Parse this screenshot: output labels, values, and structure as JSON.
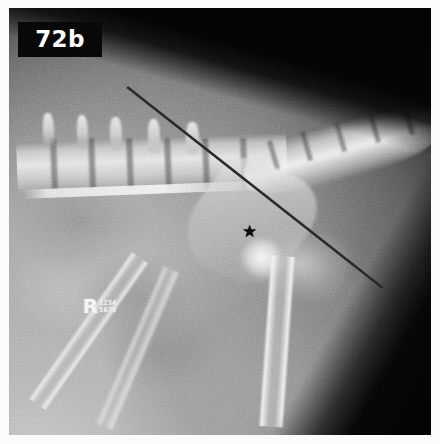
{
  "figure": {
    "label": "72b",
    "caption_present": false
  },
  "image": {
    "modality": "radiograph",
    "view": "lateral",
    "region": "caudal lumbar spine, pelvis and hip",
    "width": 440,
    "height": 444,
    "border_color": "#fbfbfb",
    "background_color": "#050505"
  },
  "annotations": {
    "badge": {
      "text": "72b",
      "text_color": "#ffffff",
      "background_color": "#080808"
    },
    "star": {
      "glyph": "★",
      "color": "#0d0d0d",
      "x_pct": 55.3,
      "y_pct": 50.6
    },
    "measurement_line": {
      "color": "#2a2a2a",
      "stroke_width": 2.6,
      "x1_pct": 28.0,
      "y1_pct": 18.5,
      "x2_pct": 88.5,
      "y2_pct": 65.5
    },
    "side_marker": {
      "letter": "R",
      "id_text": "1234\n5678",
      "color": "#f4f4f4"
    }
  },
  "anatomy": {
    "discs_x_pct": [
      10,
      19,
      28,
      37,
      46,
      55
    ],
    "spinous_processes": [
      {
        "left_pct": 8,
        "top_pct": 24.5,
        "width_pct": 2.6,
        "height_pct": 8.0,
        "rotate_deg": -3
      },
      {
        "left_pct": 16,
        "top_pct": 25.0,
        "width_pct": 2.6,
        "height_pct": 8.0,
        "rotate_deg": -3
      },
      {
        "left_pct": 24,
        "top_pct": 25.5,
        "width_pct": 2.8,
        "height_pct": 8.0,
        "rotate_deg": -2
      },
      {
        "left_pct": 33,
        "top_pct": 26.0,
        "width_pct": 2.8,
        "height_pct": 8.0,
        "rotate_deg": -2
      },
      {
        "left_pct": 42,
        "top_pct": 26.8,
        "width_pct": 3.0,
        "height_pct": 7.5,
        "rotate_deg": -1
      }
    ],
    "tail_segments_left_pct": [
      62,
      70,
      78,
      86,
      94
    ]
  }
}
